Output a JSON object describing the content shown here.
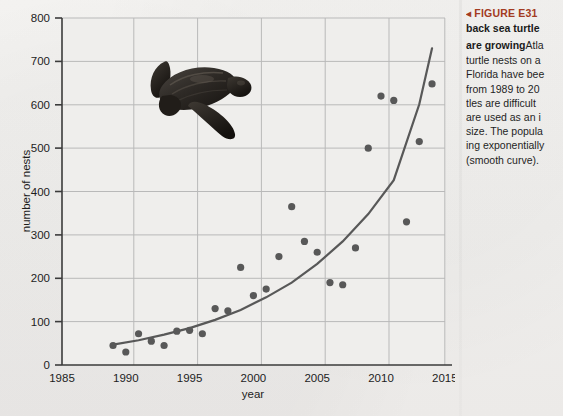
{
  "figure": {
    "caption_marker": "◂",
    "caption_label": "FIGURE E31",
    "caption_bold_lines": [
      "back sea turtle",
      "are growing"
    ],
    "caption_lines": [
      "Atla",
      "turtle nests on a",
      "Florida have bee",
      "from 1989 to 20",
      "tles are difficult",
      "are used as an i",
      "size. The popula",
      "ing exponentially",
      "(smooth curve)."
    ],
    "illustration_name": "leatherback-sea-turtle"
  },
  "colors": {
    "caption_accent": "#a33b22",
    "axis": "#3b3b3b",
    "grid": "#b9b9b9",
    "point": "#585858",
    "curve": "#585858",
    "background": "#f2f1ef",
    "plot_background": "#efeeec"
  },
  "chart_data": {
    "type": "scatter",
    "title": "",
    "xlabel": "year",
    "ylabel": "number of nests",
    "xlim": [
      1985,
      2015
    ],
    "ylim": [
      0,
      800
    ],
    "xticks": [
      1985,
      1990,
      1995,
      2000,
      2005,
      2010,
      2015
    ],
    "yticks": [
      0,
      100,
      200,
      300,
      400,
      500,
      600,
      700,
      800
    ],
    "grid": true,
    "legend": "none",
    "series": [
      {
        "name": "leatherback nests",
        "kind": "scatter",
        "x": [
          1989,
          1990,
          1991,
          1992,
          1993,
          1994,
          1995,
          1996,
          1997,
          1998,
          1999,
          2000,
          2001,
          2002,
          2003,
          2004,
          2005,
          2006,
          2007,
          2008,
          2009,
          2010,
          2011,
          2012,
          2013,
          2014
        ],
        "y": [
          45,
          30,
          72,
          55,
          45,
          78,
          80,
          72,
          130,
          125,
          225,
          160,
          175,
          250,
          365,
          285,
          260,
          190,
          185,
          270,
          500,
          620,
          610,
          330,
          515,
          648
        ]
      },
      {
        "name": "exponential fit",
        "kind": "line",
        "x": [
          1989,
          1991,
          1993,
          1995,
          1997,
          1999,
          2001,
          2003,
          2005,
          2007,
          2009,
          2011,
          2013,
          2014
        ],
        "y": [
          47,
          57,
          70,
          85,
          104,
          127,
          156,
          190,
          233,
          285,
          348,
          426,
          601,
          730
        ]
      }
    ]
  }
}
